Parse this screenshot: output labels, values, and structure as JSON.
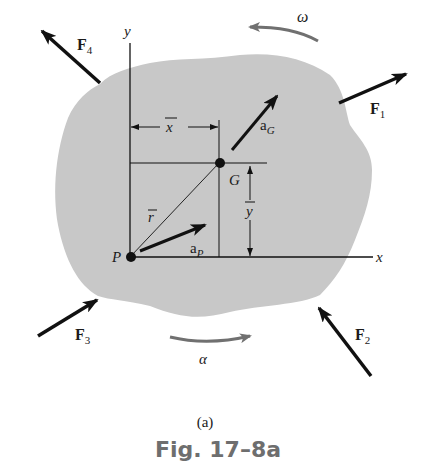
{
  "figure": {
    "sublabel": "(a)",
    "caption": "Fig. 17–8a",
    "colors": {
      "body_fill": "#c8c8c8",
      "ink": "#111111",
      "rotation_arrows": "#707070",
      "caption": "#6e6e6e"
    },
    "axes": {
      "x_label": "x",
      "y_label": "y"
    },
    "points": {
      "P": "P",
      "G": "G"
    },
    "dimensions": {
      "x_bar": "x",
      "y_bar": "y",
      "r_bar": "r"
    },
    "vectors": {
      "a_G": {
        "base": "a",
        "sub": "G"
      },
      "a_P": {
        "base": "a",
        "sub": "P"
      },
      "F1": {
        "base": "F",
        "sub": "1"
      },
      "F2": {
        "base": "F",
        "sub": "2"
      },
      "F3": {
        "base": "F",
        "sub": "3"
      },
      "F4": {
        "base": "F",
        "sub": "4"
      }
    },
    "rotation": {
      "omega": "ω",
      "alpha": "α"
    }
  }
}
